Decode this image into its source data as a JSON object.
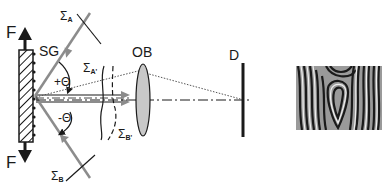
{
  "diagram": {
    "labels": {
      "force_top": "F",
      "force_bottom": "F",
      "grating": "SG",
      "sigma_a": {
        "sym": "Σ",
        "sub": "A"
      },
      "sigma_b": {
        "sym": "Σ",
        "sub": "B"
      },
      "sigma_a_prime": {
        "sym": "Σ",
        "sub": "A'"
      },
      "sigma_b_prime": {
        "sym": "Σ",
        "sub": "B'"
      },
      "angle_plus": "+Θ",
      "angle_minus": "-Θ",
      "objective": "OB",
      "detector": "D"
    },
    "components": [
      "specimen grating (hatched block)",
      "incident beam A",
      "incident beam B",
      "objective lens",
      "detector screen",
      "moiré fringe pattern image"
    ],
    "colors": {
      "beam": "#8c8c8c",
      "ink": "#1a1a1a",
      "lens_fill": "#c8c8c8"
    }
  }
}
